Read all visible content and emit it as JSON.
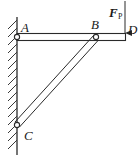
{
  "diagram": {
    "type": "statics structure: horizontal beam ABD pinned to wall at A, supported by inclined bar BC pinned to wall at C",
    "points": {
      "A": "A",
      "B": "B",
      "C": "C",
      "D": "D"
    },
    "force": {
      "symbol": "F",
      "subscript": "P",
      "direction": "downward at D"
    },
    "colors": {
      "line": "#2a2a2a",
      "background": "#ffffff"
    }
  }
}
